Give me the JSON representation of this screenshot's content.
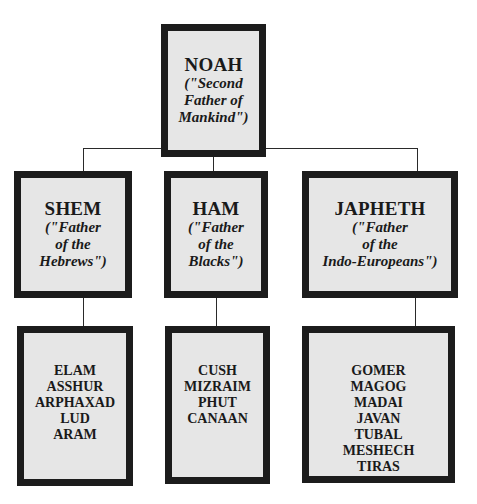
{
  "root": {
    "name": "NOAH",
    "title_lines": [
      "(\"Second",
      "Father of",
      "Mankind\")"
    ]
  },
  "sons": [
    {
      "name": "SHEM",
      "title_lines": [
        "(\"Father",
        "of the",
        "Hebrews\")"
      ],
      "descendants": [
        "ELAM",
        "ASSHUR",
        "ARPHAXAD",
        "LUD",
        "ARAM"
      ]
    },
    {
      "name": "HAM",
      "title_lines": [
        "(\"Father",
        "of the",
        "Blacks\")"
      ],
      "descendants": [
        "CUSH",
        "MIZRAIM",
        "PHUT",
        "CANAAN"
      ]
    },
    {
      "name": "JAPHETH",
      "title_lines": [
        "(\"Father",
        "of the",
        "Indo-Europeans\")"
      ],
      "descendants": [
        "GOMER",
        "MAGOG",
        "MADAI",
        "JAVAN",
        "TUBAL",
        "MESHECH",
        "TIRAS"
      ]
    }
  ],
  "colors": {
    "box_fill": "#e6e6e6",
    "box_border": "#1c1c1c",
    "connector": "#2a2a2a"
  }
}
